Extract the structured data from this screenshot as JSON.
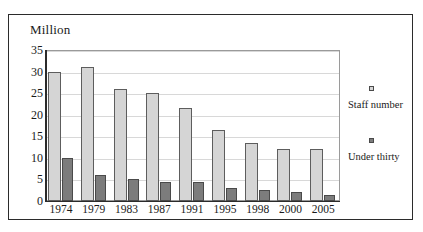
{
  "figure": {
    "clipped_caption": "",
    "unit_label": "Million"
  },
  "legend": {
    "entries": [
      {
        "label": "Staff  number",
        "color": "#d5d5d5",
        "swatch": "legend-swatch-staff"
      },
      {
        "label": "Under thirty",
        "color": "#7c7c7c",
        "swatch": "legend-swatch-under"
      }
    ]
  },
  "chart_data": {
    "type": "bar",
    "title": "",
    "subtitle": "",
    "xlabel": "",
    "ylabel": "Million",
    "ylim": [
      0,
      35
    ],
    "ytick_labels": [
      "35",
      "30",
      "25",
      "20",
      "15",
      "10",
      "5",
      "0"
    ],
    "ytick_values": [
      35,
      30,
      25,
      20,
      15,
      10,
      5,
      0
    ],
    "grid": true,
    "legend_position": "right",
    "categories": [
      "1974",
      "1979",
      "1983",
      "1987",
      "1991",
      "1995",
      "1998",
      "2000",
      "2005"
    ],
    "series": [
      {
        "name": "Staff  number",
        "color": "#d5d5d5",
        "values": [
          30,
          31,
          26,
          25,
          21.5,
          16.5,
          13.5,
          12,
          12
        ]
      },
      {
        "name": "Under thirty",
        "color": "#7c7c7c",
        "values": [
          10,
          6,
          5,
          4.5,
          4.5,
          3,
          2.5,
          2,
          1.5
        ]
      }
    ]
  }
}
